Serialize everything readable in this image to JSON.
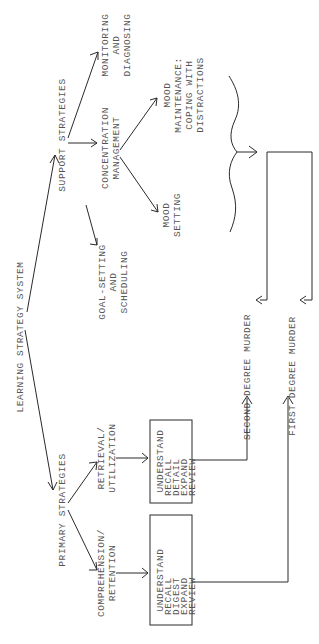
{
  "diagram": {
    "root": "LEARNING STRATEGY SYSTEM",
    "support": {
      "label": "SUPPORT STRATEGIES",
      "children": {
        "monitoring": [
          "MONITORING",
          "AND",
          "DIAGNOSING"
        ],
        "concentration": [
          "CONCENTRATION",
          "MANAGEMENT"
        ],
        "goal": [
          "GOAL-SETTING",
          "AND",
          "SCHEDULING"
        ]
      },
      "concentration_children": {
        "maintenance": [
          "MOOD",
          "MAINTENANCE:",
          "COPING WITH",
          "DISTRACTIONS"
        ],
        "setting": [
          "MOOD",
          "SETTING"
        ]
      }
    },
    "primary": {
      "label": "PRIMARY STRATEGIES",
      "children": {
        "retrieval": [
          "RETRIEVAL/",
          "UTILIZATION"
        ],
        "comprehension": [
          "COMPREHENSION/",
          "RETENTION"
        ]
      },
      "retrieval_box": [
        "UNDERSTAND",
        "RECALL",
        "DETAIL",
        "EXPAND",
        "REVIEW"
      ],
      "comprehension_box": [
        "UNDERSTAND",
        "RECALL",
        "DIGEST",
        "EXPAND",
        "REVIEW"
      ]
    },
    "outcomes": {
      "second": "SECOND DEGREE MURDER",
      "first": "FIRST DEGREE MURDER"
    }
  }
}
